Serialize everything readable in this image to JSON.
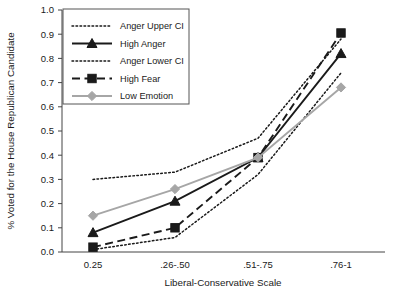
{
  "chart_data": {
    "type": "line",
    "title": "",
    "xlabel": "Liberal-Conservative Scale",
    "ylabel": "% Voted for the House Republican Candidate",
    "categories": [
      "0.25",
      ".26-.50",
      ".51-.75",
      ".76-1"
    ],
    "ylim": [
      0.0,
      1.0
    ],
    "ytick_labels": [
      "0.0",
      "0.1",
      "0.2",
      "0.3",
      "0.4",
      "0.5",
      "0.6",
      "0.7",
      "0.8",
      "0.9",
      "1.0"
    ],
    "ytick_values": [
      0.0,
      0.1,
      0.2,
      0.3,
      0.4,
      0.5,
      0.6,
      0.7,
      0.8,
      0.9,
      1.0
    ],
    "grid": false,
    "legend_position": "top-left-inside",
    "series": [
      {
        "name": "Anger Upper CI",
        "values": [
          0.3,
          0.33,
          0.47,
          0.88
        ],
        "color": "#1a1a1a",
        "style": "dotted",
        "marker": "none"
      },
      {
        "name": "High Anger",
        "values": [
          0.08,
          0.21,
          0.39,
          0.82
        ],
        "color": "#1a1a1a",
        "style": "solid",
        "marker": "triangle"
      },
      {
        "name": "Anger Lower CI",
        "values": [
          0.01,
          0.06,
          0.32,
          0.74
        ],
        "color": "#1a1a1a",
        "style": "dotted",
        "marker": "none"
      },
      {
        "name": "High Fear",
        "values": [
          0.02,
          0.1,
          0.39,
          0.905
        ],
        "color": "#1a1a1a",
        "style": "dashed",
        "marker": "square"
      },
      {
        "name": "Low Emotion",
        "values": [
          0.15,
          0.26,
          0.39,
          0.68
        ],
        "color": "#a6a6a6",
        "style": "solid",
        "marker": "diamond"
      }
    ]
  },
  "legend": {
    "items": [
      {
        "label": "Anger Upper CI"
      },
      {
        "label": "High Anger"
      },
      {
        "label": "Anger Lower CI"
      },
      {
        "label": "High Fear"
      },
      {
        "label": "Low Emotion"
      }
    ]
  }
}
